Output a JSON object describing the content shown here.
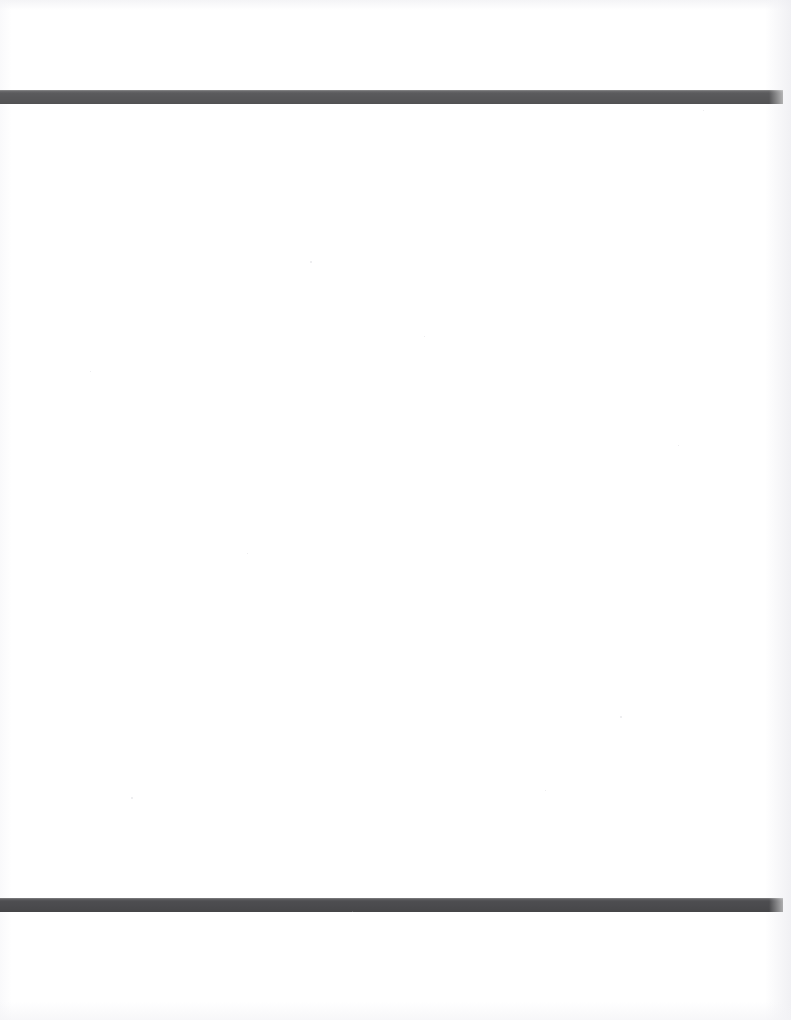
{
  "document": {
    "kind": "scanned-blank-page",
    "page_width": 791,
    "page_height": 1020,
    "background_color": "#ffffff",
    "paper_tone": "#fefefe",
    "visible_text": "",
    "body_text": "",
    "header_text": "",
    "footer_text": "",
    "page_number": ""
  },
  "rules": {
    "color_top": "#5a5a5c",
    "color_bottom": "#4d4d50",
    "top": {
      "name": "top-horizontal-rule",
      "x": 0,
      "y": 90,
      "width": 783,
      "height": 14,
      "color": "#5a5a5c"
    },
    "bottom": {
      "name": "bottom-horizontal-rule",
      "x": 0,
      "y": 898,
      "width": 783,
      "height": 14,
      "color": "#4d4d50"
    }
  },
  "regions": {
    "above_top_rule": {
      "label": "",
      "y_start": 0,
      "y_end": 90,
      "content": ""
    },
    "between_rules": {
      "label": "",
      "y_start": 104,
      "y_end": 898,
      "content": ""
    },
    "below_bottom_rule": {
      "label": "",
      "y_start": 912,
      "y_end": 1020,
      "content": ""
    }
  },
  "speckles": [
    {
      "x": 310,
      "y": 261,
      "size": 2
    },
    {
      "x": 131,
      "y": 797,
      "size": 2
    },
    {
      "x": 424,
      "y": 336,
      "size": 1
    },
    {
      "x": 620,
      "y": 716,
      "size": 2
    },
    {
      "x": 545,
      "y": 790,
      "size": 1
    },
    {
      "x": 703,
      "y": 110,
      "size": 1
    },
    {
      "x": 247,
      "y": 553,
      "size": 1
    },
    {
      "x": 352,
      "y": 911,
      "size": 1
    },
    {
      "x": 678,
      "y": 445,
      "size": 1
    },
    {
      "x": 90,
      "y": 371,
      "size": 1
    }
  ]
}
